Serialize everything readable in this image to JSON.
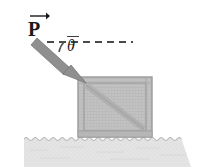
{
  "figure": {
    "background_color": "#ffffff"
  },
  "labels": {
    "force_symbol": "P",
    "angle_symbol": "θ"
  },
  "colors": {
    "arrow_gray": "#8c8c8c",
    "arrow_outline": "#6e6e6e",
    "crate_fill": "#c2c2c2",
    "crate_frame": "#a8a8a8",
    "crate_edge": "#9a9a9a",
    "ground_fill": "#e2e2e2",
    "ground_line": "#b4b4b4",
    "dash_color": "#4a4a4a",
    "text_color": "#1a1a1a"
  },
  "geometry": {
    "force_arrow": {
      "tail_x": 39,
      "tail_y": 41,
      "tip_x": 84,
      "tip_y": 81,
      "shaft_width": 7,
      "head_length": 17,
      "head_width": 16
    },
    "horizontal_dashed_line": {
      "x_start": 47,
      "x_end": 133,
      "y": 42,
      "dash_length": 7,
      "gap_length": 5,
      "stroke_width": 2
    },
    "angle_arc": {
      "cx": 47,
      "cy": 42,
      "radius": 20,
      "start_deg": 0,
      "end_deg": 42
    },
    "crate": {
      "x": 78,
      "y": 77,
      "width": 74,
      "height": 60,
      "frame_inset": 6,
      "diagonal": "top-left-to-bottom-right"
    },
    "ground": {
      "x_start": 24,
      "x_end": 191,
      "y_top": 137,
      "y_bottom": 167,
      "wave_amplitude": 2,
      "wave_period": 9
    }
  }
}
